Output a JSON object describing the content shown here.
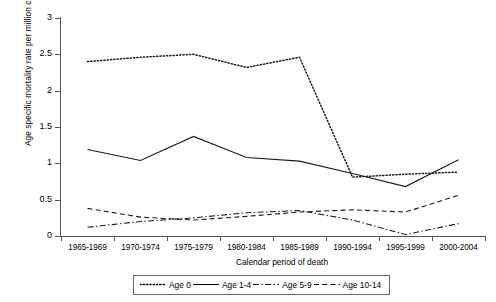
{
  "chart_data": {
    "type": "line",
    "title": "",
    "xlabel": "Calendar period of death",
    "ylabel": "Age specific mortality rate per million child years",
    "categories": [
      "1965-1969",
      "1970-1974",
      "1975-1979",
      "1980-1984",
      "1985-1989",
      "1990-1994",
      "1995-1999",
      "2000-2004"
    ],
    "ylim": [
      0,
      3
    ],
    "yticks": [
      "0",
      "0.5",
      "1",
      "1.5",
      "2",
      "2.5",
      "3"
    ],
    "grid": false,
    "legend_position": "bottom",
    "series": [
      {
        "name": "Age 0",
        "style": "dotted",
        "values": [
          2.4,
          2.46,
          2.5,
          2.32,
          2.46,
          0.81,
          0.85,
          0.88
        ]
      },
      {
        "name": "Age 1-4",
        "style": "solid",
        "values": [
          1.19,
          1.04,
          1.37,
          1.08,
          1.03,
          0.86,
          0.68,
          1.05
        ]
      },
      {
        "name": "Age 5-9",
        "style": "dash-dot",
        "values": [
          0.12,
          0.2,
          0.25,
          0.32,
          0.35,
          0.22,
          0.02,
          0.17
        ]
      },
      {
        "name": "Age 10-14",
        "style": "dashed",
        "values": [
          0.38,
          0.26,
          0.22,
          0.27,
          0.33,
          0.36,
          0.33,
          0.56
        ]
      }
    ]
  },
  "axis": {
    "y_ticks": [
      "3",
      "2.5",
      "2",
      "1.5",
      "1",
      "0.5",
      "0"
    ]
  },
  "legend": {
    "items": [
      {
        "label": "Age 0"
      },
      {
        "label": "Age 1-4"
      },
      {
        "label": "Age 5-9"
      },
      {
        "label": "Age 10-14"
      }
    ]
  }
}
